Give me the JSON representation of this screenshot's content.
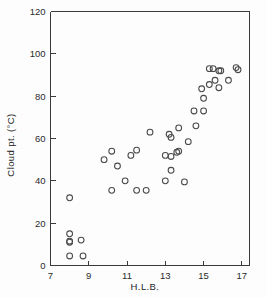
{
  "chart_data": {
    "type": "scatter",
    "title": "",
    "xlabel": "H.L.B.",
    "ylabel": "Cloud pt. (°C)",
    "xlim": [
      7,
      17.4
    ],
    "ylim": [
      0,
      120
    ],
    "xticks": [
      7,
      9,
      11,
      13,
      15,
      17
    ],
    "yticks": [
      0,
      20,
      40,
      60,
      80,
      100,
      120
    ],
    "xtick_labels": [
      "7",
      "9",
      "11",
      "13",
      "15",
      "17"
    ],
    "ytick_labels": [
      "0",
      "20",
      "40",
      "60",
      "80",
      "100",
      "120"
    ],
    "grid": false,
    "legend": null,
    "marker": "open-circle",
    "marker_color": "#4a4a4a",
    "points": [
      {
        "x": 8.0,
        "y": 32.0
      },
      {
        "x": 8.0,
        "y": 15.0
      },
      {
        "x": 8.0,
        "y": 11.5
      },
      {
        "x": 8.0,
        "y": 11.0
      },
      {
        "x": 8.6,
        "y": 12.0
      },
      {
        "x": 8.0,
        "y": 4.5
      },
      {
        "x": 8.7,
        "y": 4.5
      },
      {
        "x": 9.8,
        "y": 50.0
      },
      {
        "x": 10.2,
        "y": 54.0
      },
      {
        "x": 10.2,
        "y": 35.5
      },
      {
        "x": 10.5,
        "y": 47.0
      },
      {
        "x": 10.9,
        "y": 40.0
      },
      {
        "x": 11.2,
        "y": 52.0
      },
      {
        "x": 11.5,
        "y": 54.5
      },
      {
        "x": 11.5,
        "y": 35.5
      },
      {
        "x": 12.0,
        "y": 35.5
      },
      {
        "x": 12.2,
        "y": 63.0
      },
      {
        "x": 13.0,
        "y": 52.0
      },
      {
        "x": 13.0,
        "y": 40.0
      },
      {
        "x": 13.2,
        "y": 62.0
      },
      {
        "x": 13.3,
        "y": 60.5
      },
      {
        "x": 13.3,
        "y": 51.5
      },
      {
        "x": 13.3,
        "y": 45.0
      },
      {
        "x": 13.6,
        "y": 53.5
      },
      {
        "x": 13.7,
        "y": 54.0
      },
      {
        "x": 13.7,
        "y": 65.0
      },
      {
        "x": 14.0,
        "y": 39.5
      },
      {
        "x": 14.2,
        "y": 58.5
      },
      {
        "x": 14.5,
        "y": 73.0
      },
      {
        "x": 14.6,
        "y": 66.0
      },
      {
        "x": 15.0,
        "y": 73.0
      },
      {
        "x": 15.0,
        "y": 79.0
      },
      {
        "x": 14.9,
        "y": 83.5
      },
      {
        "x": 15.3,
        "y": 93.0
      },
      {
        "x": 15.5,
        "y": 93.0
      },
      {
        "x": 15.3,
        "y": 85.5
      },
      {
        "x": 15.6,
        "y": 87.5
      },
      {
        "x": 15.8,
        "y": 92.0
      },
      {
        "x": 15.9,
        "y": 92.0
      },
      {
        "x": 15.8,
        "y": 84.0
      },
      {
        "x": 16.3,
        "y": 87.5
      },
      {
        "x": 16.7,
        "y": 93.5
      },
      {
        "x": 16.8,
        "y": 92.5
      }
    ]
  }
}
